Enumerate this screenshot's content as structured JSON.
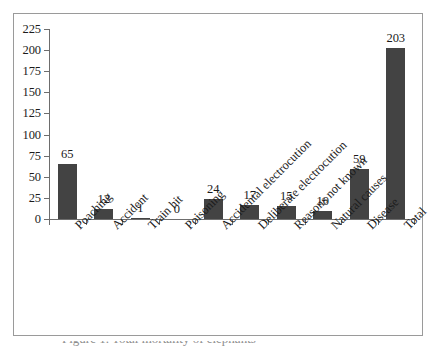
{
  "chart_data": {
    "type": "bar",
    "title": "",
    "subtitle": "",
    "xlabel": "",
    "ylabel": "",
    "ylim": [
      0,
      225
    ],
    "ytick_step": 25,
    "yticks": [
      0,
      25,
      50,
      75,
      100,
      125,
      150,
      175,
      200,
      225
    ],
    "ytick_labels": [
      "0",
      "25",
      "50",
      "75",
      "100",
      "125",
      "150",
      "175",
      "200",
      "225"
    ],
    "grid": false,
    "legend": false,
    "legend_position": "none",
    "data_labels": true,
    "bar_color": "#434343",
    "axis_color": "#6d6d6d",
    "frame_color": "#9a9a9a",
    "categories": [
      "Poaching",
      "Accident",
      "Train hit",
      "Poisoning",
      "Accidental electrocution",
      "Deliberate electrocution",
      "Reasons not known",
      "Natural causes",
      "Disease",
      "Total"
    ],
    "values": [
      65,
      12,
      1,
      0,
      24,
      17,
      15,
      10,
      59,
      203
    ],
    "value_labels": [
      "65",
      "12",
      "1",
      "0",
      "24",
      "17",
      "15",
      "10",
      "59",
      "203"
    ]
  },
  "caption": {
    "text": "Figure 1. Total mortality of elephants"
  }
}
